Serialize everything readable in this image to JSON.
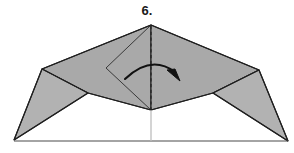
{
  "figure": {
    "step_label": "6.",
    "kind": "origami-fold-diagram",
    "caption_position": "top-center"
  },
  "colors": {
    "paper_shaded": "#a9a9a9",
    "paper_shaded_light": "#b4b4b4",
    "paper_white": "#ffffff",
    "outline": "#1f1f1f",
    "crease_solid": "#3a3a3a",
    "crease_dashed": "#222222",
    "center_line_light": "#bdbdbd",
    "arrow": "#111111",
    "background": "#ffffff",
    "label_text": "#1a1a1a"
  },
  "geometry": {
    "canvas": {
      "width": 294,
      "height": 153
    },
    "points": {
      "apex_top": [
        151,
        25
      ],
      "left_shoulder": [
        42,
        69
      ],
      "right_shoulder": [
        259,
        70
      ],
      "center_bottom": [
        151,
        110
      ],
      "bottom_left_corner": [
        14,
        140
      ],
      "bottom_right_corner": [
        288,
        141
      ],
      "left_inner_diamond": [
        106,
        68
      ],
      "left_wing_inner": [
        88,
        93
      ],
      "right_wing_inner": [
        213,
        93
      ],
      "baseline_left": [
        14,
        141
      ],
      "baseline_right": [
        288,
        141
      ]
    },
    "shapes": [
      {
        "name": "left-upper-panel",
        "polygon": "151,25 42,69 88,93 151,110",
        "fill": "paper_shaded"
      },
      {
        "name": "right-upper-panel",
        "polygon": "151,25 259,70 213,93 151,110",
        "fill": "paper_shaded"
      },
      {
        "name": "left-wing",
        "polygon": "42,69 88,93 14,140",
        "fill": "paper_shaded_light"
      },
      {
        "name": "right-wing",
        "polygon": "259,70 213,93 288,141",
        "fill": "paper_shaded_light"
      }
    ],
    "creases": [
      {
        "name": "inner-diamond-left",
        "path": "151,25 106,68 151,110",
        "style": "solid"
      },
      {
        "name": "left-wing-crease",
        "path": "42,69 88,93",
        "style": "solid"
      },
      {
        "name": "right-wing-crease",
        "path": "259,70 213,93",
        "style": "solid"
      },
      {
        "name": "center-fold",
        "path": "151,25 151,110",
        "style": "dashed"
      },
      {
        "name": "center-guide-below",
        "path": "151,110 151,141",
        "style": "light-solid"
      },
      {
        "name": "baseline",
        "path": "14,141 288,141",
        "style": "solid"
      }
    ],
    "arrow": {
      "name": "fold-direction-arrow",
      "kind": "curved",
      "start": [
        125,
        79
      ],
      "control": [
        151,
        56
      ],
      "end": [
        177,
        75
      ],
      "head_at": [
        178,
        79
      ],
      "direction": "left-to-right-over-center"
    }
  }
}
